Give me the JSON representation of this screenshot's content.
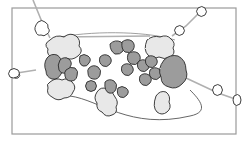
{
  "diagram": {
    "kind": "stylized cloud-blob region map",
    "frame": {
      "x": 12,
      "y": 8,
      "width": 224,
      "height": 126,
      "stroke": "#9a9a9a"
    },
    "colors": {
      "dark_fill": "#9c9c9c",
      "light_fill": "#e8e8e8",
      "outline": "#2a2a2a",
      "connector": "#b0b0b0",
      "boundary": "#555555",
      "background": "#ffffff"
    },
    "labels": []
  }
}
